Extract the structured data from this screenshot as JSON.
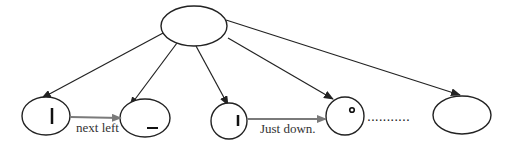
{
  "diagram": {
    "type": "tree",
    "colors": {
      "stroke": "#222222",
      "gray_arrow": "#7a7a7a",
      "background": "#ffffff"
    },
    "root": {
      "id": "root",
      "shape": "ellipse",
      "label": ""
    },
    "children": [
      {
        "id": "child-1",
        "shape": "ellipse",
        "glyph": "vertical-bar"
      },
      {
        "id": "child-2",
        "shape": "ellipse",
        "glyph": "horizontal-bar"
      },
      {
        "id": "child-3",
        "shape": "circle",
        "glyph": "short-vertical-bar"
      },
      {
        "id": "child-4",
        "shape": "circle",
        "glyph": "small-circle"
      },
      {
        "id": "child-5",
        "shape": "ellipse",
        "glyph": ""
      }
    ],
    "edges": [
      {
        "from": "root",
        "to": "child-1"
      },
      {
        "from": "root",
        "to": "child-2"
      },
      {
        "from": "root",
        "to": "child-3"
      },
      {
        "from": "root",
        "to": "child-4"
      },
      {
        "from": "root",
        "to": "child-5"
      }
    ],
    "sibling_arrows": [
      {
        "from": "child-1",
        "to": "child-2",
        "label": "next left"
      },
      {
        "from": "child-3",
        "to": "child-4",
        "label": "Just down."
      }
    ],
    "ellipsis": "..........."
  }
}
